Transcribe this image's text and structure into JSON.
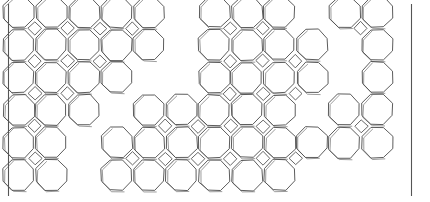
{
  "figure": {
    "background_color": "#ffffff",
    "line_color": "#4a4a4a",
    "shadow_line_color": "#8a8a8a",
    "frame_color": "#555555"
  },
  "layout": {
    "width": 430,
    "height": 202,
    "origin_x": 18.5,
    "origin_y": 12.0,
    "pitch_x": 32.6,
    "pitch_y": 32.6,
    "octagon_radius": 16.4,
    "rows": 6,
    "cols": 12,
    "sketch_offset": 2.0
  },
  "frame": {
    "left_line": {
      "x": 8.5,
      "y1": 4.0,
      "y2": 196.0
    },
    "right_line": {
      "x": 411.5,
      "y1": 4.0,
      "y2": 196.0
    }
  },
  "grid": {
    "legend": "1 = octagon present, 0 = empty cell; row 0 is top",
    "occupancy": [
      [
        1,
        1,
        1,
        1,
        1,
        0,
        1,
        1,
        1,
        0,
        1,
        1
      ],
      [
        1,
        1,
        1,
        1,
        1,
        0,
        1,
        1,
        1,
        1,
        0,
        1
      ],
      [
        1,
        1,
        1,
        1,
        0,
        0,
        1,
        1,
        1,
        1,
        0,
        1
      ],
      [
        1,
        1,
        1,
        0,
        1,
        1,
        1,
        1,
        1,
        0,
        1,
        1
      ],
      [
        1,
        1,
        0,
        1,
        1,
        1,
        1,
        1,
        1,
        1,
        1,
        1
      ],
      [
        1,
        1,
        0,
        1,
        1,
        1,
        1,
        1,
        1,
        0,
        0,
        0
      ]
    ]
  },
  "squares": {
    "legend": "small diamond squares sit at shared corners between four adjacent octagons; 1 = drawn",
    "occupancy": [
      [
        1,
        1,
        1,
        1,
        0,
        0,
        1,
        1,
        0,
        0,
        1,
        0
      ],
      [
        1,
        1,
        1,
        0,
        0,
        0,
        1,
        1,
        1,
        0,
        0,
        0
      ],
      [
        1,
        1,
        0,
        0,
        0,
        0,
        1,
        1,
        1,
        0,
        0,
        0
      ],
      [
        1,
        0,
        0,
        0,
        1,
        1,
        1,
        1,
        0,
        0,
        1,
        0
      ],
      [
        1,
        0,
        0,
        1,
        1,
        1,
        1,
        1,
        1,
        0,
        0,
        0
      ],
      [
        0,
        0,
        0,
        0,
        0,
        0,
        0,
        0,
        0,
        0,
        0,
        0
      ]
    ]
  }
}
